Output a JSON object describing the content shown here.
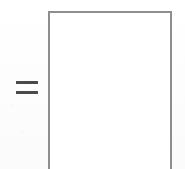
{
  "image": {
    "kind": "scanned-math-notation",
    "width": 185,
    "height": 169,
    "background_color": "#fefefe",
    "description": "An equals sign followed by a tall empty rectangular box whose bottom edge is cropped off by the image frame."
  },
  "elements": {
    "equals_sign": {
      "symbol": "=",
      "name": "equals-sign",
      "color": "#4a4a4a",
      "x": 16,
      "y": 81,
      "width": 22,
      "height": 16,
      "bar_count": 2,
      "bar_thickness": 3,
      "bars": [
        {
          "label": "upper-bar",
          "offset_y": 0
        },
        {
          "label": "lower-bar",
          "offset_y": 10
        }
      ]
    },
    "box": {
      "name": "empty-box",
      "color": "#8e8e8e",
      "fill": "#ffffff",
      "stroke_width": 1.6,
      "x": 48,
      "y": 11,
      "width": 124,
      "height": 158,
      "open_side": "bottom",
      "content": "",
      "edges": [
        {
          "label": "top-edge",
          "drawn": "yes"
        },
        {
          "label": "left-edge",
          "drawn": "yes"
        },
        {
          "label": "right-edge",
          "drawn": "yes"
        },
        {
          "label": "bottom-edge",
          "drawn": "no"
        }
      ]
    }
  }
}
